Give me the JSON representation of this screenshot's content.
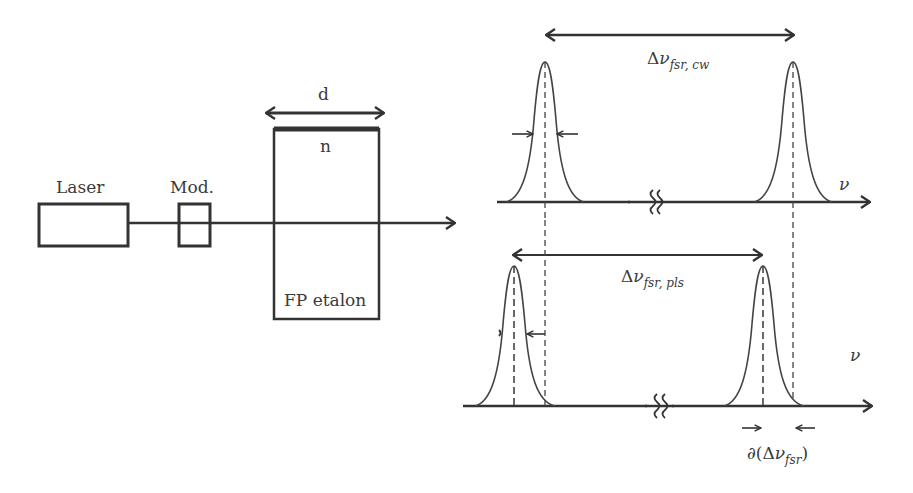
{
  "setup": {
    "laser_label": "Laser",
    "modulator_label": "Mod.",
    "etalon_label": "FP etalon",
    "thickness_label": "d",
    "index_label": "n"
  },
  "spectrum_cw": {
    "delta": "Δ",
    "nu": "ν",
    "subscript": "fsr, cw",
    "axis_label": "ν"
  },
  "spectrum_pulsed": {
    "delta": "Δ",
    "nu": "ν",
    "subscript": "fsr, pls",
    "axis_label": "ν",
    "shift_prefix": "∂(Δ",
    "shift_nu": "ν",
    "shift_subscript": "fsr",
    "shift_suffix": ")"
  },
  "colors": {
    "line": "#333333",
    "text": "#3a3a3a",
    "background": "#ffffff"
  }
}
